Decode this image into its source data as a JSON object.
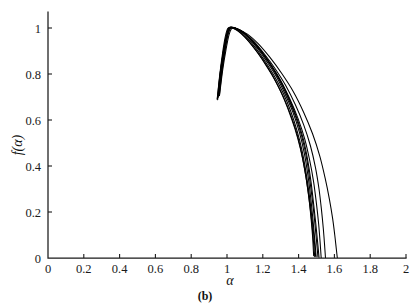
{
  "figure": {
    "caption": "(b)",
    "background_color": "#ffffff",
    "line_color": "#000000",
    "axis_color": "#1a1a1a"
  },
  "chart_data": {
    "type": "line",
    "title": "",
    "subtitle": "",
    "xlabel": "α",
    "ylabel": "f(α)",
    "xlim": [
      0,
      2
    ],
    "ylim": [
      0,
      1.12
    ],
    "grid": false,
    "legend": "none",
    "xticks": [
      0,
      0.2,
      0.4,
      0.6,
      0.8,
      1,
      1.2,
      1.4,
      1.6,
      1.8,
      2
    ],
    "xticklabels": [
      "0",
      "0.2",
      "0.4",
      "0.6",
      "0.8",
      "1",
      "1.2",
      "1.4",
      "1.6",
      "1.8",
      "2"
    ],
    "yticks": [
      0,
      0.2,
      0.4,
      0.6,
      0.8,
      1
    ],
    "yticklabels": [
      "0",
      "0.2",
      "0.4",
      "0.6",
      "0.8",
      "1"
    ],
    "annotation": "Multifractal singularity spectra f(α) — nine overlapping curves peaking near α = 1, f(α) = 1",
    "series": [
      {
        "name": "curve-1",
        "x": [
          0.945,
          0.96,
          0.975,
          0.99,
          1.005,
          1.03,
          1.06,
          1.1,
          1.15,
          1.2,
          1.25,
          1.3,
          1.34,
          1.38,
          1.41,
          1.435,
          1.455,
          1.468,
          1.478,
          1.484
        ],
        "y": [
          0.69,
          0.8,
          0.89,
          0.96,
          0.999,
          1.0,
          0.988,
          0.96,
          0.915,
          0.862,
          0.8,
          0.724,
          0.65,
          0.56,
          0.475,
          0.38,
          0.28,
          0.185,
          0.095,
          0.01
        ]
      },
      {
        "name": "curve-2",
        "x": [
          0.95,
          0.965,
          0.98,
          0.998,
          1.012,
          1.04,
          1.075,
          1.115,
          1.165,
          1.215,
          1.265,
          1.315,
          1.355,
          1.392,
          1.42,
          1.442,
          1.46,
          1.474,
          1.486,
          1.495
        ],
        "y": [
          0.7,
          0.81,
          0.898,
          0.968,
          1.002,
          1.0,
          0.985,
          0.955,
          0.908,
          0.852,
          0.79,
          0.715,
          0.64,
          0.552,
          0.465,
          0.37,
          0.272,
          0.178,
          0.09,
          0.008
        ]
      },
      {
        "name": "curve-3",
        "x": [
          0.948,
          0.962,
          0.978,
          0.995,
          1.01,
          1.038,
          1.072,
          1.112,
          1.162,
          1.212,
          1.262,
          1.312,
          1.352,
          1.39,
          1.418,
          1.44,
          1.458,
          1.472,
          1.482,
          1.49
        ],
        "y": [
          0.688,
          0.802,
          0.892,
          0.964,
          1.0,
          0.998,
          0.982,
          0.95,
          0.902,
          0.845,
          0.782,
          0.706,
          0.63,
          0.542,
          0.452,
          0.358,
          0.258,
          0.168,
          0.082,
          0.006
        ]
      },
      {
        "name": "curve-4",
        "x": [
          0.952,
          0.968,
          0.984,
          1.0,
          1.016,
          1.045,
          1.08,
          1.122,
          1.172,
          1.222,
          1.275,
          1.325,
          1.368,
          1.405,
          1.432,
          1.452,
          1.468,
          1.48,
          1.49,
          1.498
        ],
        "y": [
          0.705,
          0.815,
          0.9,
          0.97,
          1.003,
          1.0,
          0.986,
          0.956,
          0.91,
          0.855,
          0.79,
          0.712,
          0.634,
          0.545,
          0.455,
          0.36,
          0.26,
          0.168,
          0.082,
          0.005
        ]
      },
      {
        "name": "curve-5",
        "x": [
          0.955,
          0.972,
          0.988,
          1.004,
          1.02,
          1.05,
          1.088,
          1.132,
          1.185,
          1.238,
          1.29,
          1.34,
          1.382,
          1.418,
          1.444,
          1.462,
          1.478,
          1.49,
          1.5,
          1.508
        ],
        "y": [
          0.71,
          0.82,
          0.905,
          0.972,
          1.002,
          0.999,
          0.984,
          0.952,
          0.903,
          0.845,
          0.778,
          0.698,
          0.618,
          0.528,
          0.436,
          0.342,
          0.245,
          0.158,
          0.076,
          0.004
        ]
      },
      {
        "name": "curve-6",
        "x": [
          0.958,
          0.974,
          0.99,
          1.006,
          1.022,
          1.054,
          1.094,
          1.14,
          1.195,
          1.25,
          1.302,
          1.352,
          1.393,
          1.428,
          1.452,
          1.47,
          1.484,
          1.496,
          1.506,
          1.514
        ],
        "y": [
          0.712,
          0.822,
          0.906,
          0.973,
          1.001,
          0.997,
          0.98,
          0.946,
          0.895,
          0.834,
          0.765,
          0.684,
          0.602,
          0.512,
          0.42,
          0.328,
          0.234,
          0.15,
          0.072,
          0.003
        ]
      },
      {
        "name": "curve-7",
        "x": [
          0.946,
          0.962,
          0.98,
          0.998,
          1.014,
          1.046,
          1.086,
          1.134,
          1.19,
          1.246,
          1.3,
          1.352,
          1.396,
          1.434,
          1.462,
          1.484,
          1.5,
          1.512,
          1.52,
          1.526
        ],
        "y": [
          0.692,
          0.805,
          0.894,
          0.966,
          1.0,
          0.998,
          0.983,
          0.951,
          0.9,
          0.84,
          0.772,
          0.69,
          0.608,
          0.518,
          0.424,
          0.33,
          0.234,
          0.148,
          0.07,
          0.002
        ]
      },
      {
        "name": "curve-8",
        "x": [
          0.95,
          0.968,
          0.986,
          1.004,
          1.02,
          1.055,
          1.098,
          1.15,
          1.21,
          1.27,
          1.328,
          1.382,
          1.428,
          1.466,
          1.494,
          1.514,
          1.528,
          1.538,
          1.545,
          1.55
        ],
        "y": [
          0.698,
          0.812,
          0.9,
          0.97,
          1.001,
          0.996,
          0.978,
          0.942,
          0.886,
          0.822,
          0.75,
          0.666,
          0.58,
          0.488,
          0.394,
          0.3,
          0.208,
          0.128,
          0.058,
          0.002
        ]
      },
      {
        "name": "curve-9",
        "x": [
          0.958,
          0.976,
          0.994,
          1.012,
          1.03,
          1.068,
          1.116,
          1.174,
          1.24,
          1.306,
          1.37,
          1.428,
          1.478,
          1.518,
          1.548,
          1.572,
          1.59,
          1.602,
          1.61,
          1.616
        ],
        "y": [
          0.706,
          0.818,
          0.904,
          0.972,
          1.0,
          0.993,
          0.972,
          0.932,
          0.872,
          0.802,
          0.724,
          0.634,
          0.54,
          0.444,
          0.348,
          0.256,
          0.172,
          0.1,
          0.044,
          0.002
        ]
      }
    ]
  }
}
